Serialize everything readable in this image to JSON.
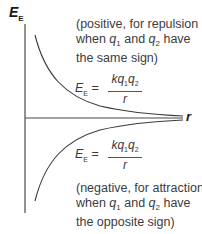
{
  "diagram": {
    "y_axis_label": "E",
    "y_axis_label_sub": "E",
    "x_axis_label": "r",
    "top_annotation": {
      "line1": "(positive, for repulsion",
      "line2_pre": "when ",
      "q1": "q",
      "q1_sub": "1",
      "line2_mid": " and ",
      "q2": "q",
      "q2_sub": "2",
      "line2_post": " have",
      "line3": "the same sign)"
    },
    "top_formula": {
      "lhs": "E",
      "lhs_sub": "E",
      "equals": " =",
      "numerator": "kq",
      "num_sub1": "1",
      "num_q": "q",
      "num_sub2": "2",
      "denominator": "r"
    },
    "bottom_formula": {
      "lhs": "E",
      "lhs_sub": "E",
      "equals": " =",
      "numerator": "kq",
      "num_sub1": "1",
      "num_q": "q",
      "num_sub2": "2",
      "denominator": "r"
    },
    "bottom_annotation": {
      "line1": "(negative, for attraction",
      "line2_pre": "when ",
      "q1": "q",
      "q1_sub": "1",
      "line2_mid": " and ",
      "q2": "q",
      "q2_sub": "2",
      "line2_post": " have",
      "line3": "the opposite sign)"
    },
    "curves": [
      {
        "name": "repulsion",
        "sign": "positive",
        "shape": "1/r decay from above"
      },
      {
        "name": "attraction",
        "sign": "negative",
        "shape": "-1/r rise from below"
      }
    ],
    "colors": {
      "axis": "#4a4a4a",
      "curve": "#3a3a3a",
      "text": "#3c3c3c"
    }
  }
}
